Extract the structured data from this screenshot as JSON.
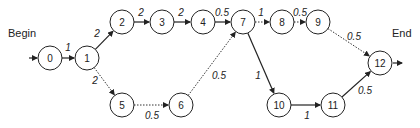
{
  "labels": {
    "begin": "Begin",
    "end": "End"
  },
  "nodes": [
    {
      "id": "0",
      "x": 50,
      "y": 58
    },
    {
      "id": "1",
      "x": 87,
      "y": 58
    },
    {
      "id": "2",
      "x": 122,
      "y": 22
    },
    {
      "id": "3",
      "x": 162,
      "y": 22
    },
    {
      "id": "4",
      "x": 203,
      "y": 22
    },
    {
      "id": "5",
      "x": 122,
      "y": 105
    },
    {
      "id": "6",
      "x": 181,
      "y": 105
    },
    {
      "id": "7",
      "x": 243,
      "y": 22
    },
    {
      "id": "8",
      "x": 282,
      "y": 22
    },
    {
      "id": "9",
      "x": 318,
      "y": 22
    },
    {
      "id": "10",
      "x": 279,
      "y": 105
    },
    {
      "id": "11",
      "x": 333,
      "y": 105
    },
    {
      "id": "12",
      "x": 380,
      "y": 63
    }
  ],
  "edges": [
    {
      "from": "0",
      "to": "1",
      "weight": "1",
      "style": "solid",
      "lx": 68,
      "ly": 51
    },
    {
      "from": "1",
      "to": "2",
      "weight": "2",
      "style": "solid",
      "lx": 97,
      "ly": 37
    },
    {
      "from": "1",
      "to": "5",
      "weight": "2",
      "style": "dotted",
      "lx": 95,
      "ly": 84
    },
    {
      "from": "2",
      "to": "3",
      "weight": "2",
      "style": "solid",
      "lx": 141,
      "ly": 16
    },
    {
      "from": "3",
      "to": "4",
      "weight": "2",
      "style": "solid",
      "lx": 181,
      "ly": 16
    },
    {
      "from": "4",
      "to": "7",
      "weight": "0.5",
      "style": "solid",
      "lx": 222,
      "ly": 16
    },
    {
      "from": "5",
      "to": "6",
      "weight": "0.5",
      "style": "dotted",
      "lx": 152,
      "ly": 119
    },
    {
      "from": "6",
      "to": "7",
      "weight": "0.5",
      "style": "dotted",
      "lx": 219,
      "ly": 79
    },
    {
      "from": "7",
      "to": "8",
      "weight": "1",
      "style": "dotted",
      "lx": 261,
      "ly": 16
    },
    {
      "from": "8",
      "to": "9",
      "weight": "0.5",
      "style": "dotted",
      "lx": 300,
      "ly": 16
    },
    {
      "from": "9",
      "to": "12",
      "weight": "0.5",
      "style": "dotted",
      "lx": 354,
      "ly": 40
    },
    {
      "from": "7",
      "to": "10",
      "weight": "1",
      "style": "solid",
      "lx": 258,
      "ly": 79
    },
    {
      "from": "10",
      "to": "11",
      "weight": "1",
      "style": "solid",
      "lx": 307,
      "ly": 119
    },
    {
      "from": "11",
      "to": "12",
      "weight": "0.5",
      "style": "solid",
      "lx": 365,
      "ly": 94
    }
  ]
}
